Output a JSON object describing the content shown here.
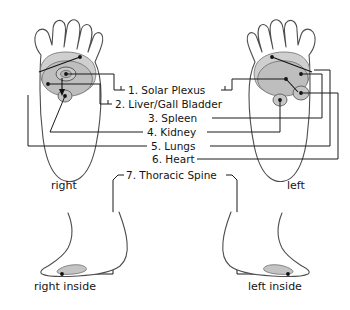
{
  "diagram": {
    "legend_items": [
      {
        "number": "1.",
        "label": "1. Solar Plexus"
      },
      {
        "number": "2.",
        "label": "2. Liver/Gall Bladder"
      },
      {
        "number": "3.",
        "label": "3. Spleen"
      },
      {
        "number": "4.",
        "label": "4. Kidney"
      },
      {
        "number": "5.",
        "label": "5. Lungs"
      },
      {
        "number": "6.",
        "label": "6. Heart"
      },
      {
        "number": "7.",
        "label": "7. Thoracic Spine"
      }
    ],
    "foot_labels": {
      "right_sole": "right",
      "left_sole": "left",
      "right_inside": "right inside",
      "left_inside": "left inside"
    },
    "colors": {
      "outline": "#4d4d4d",
      "zone_light": "#d6d6d6",
      "zone_mid": "#c2c2c2",
      "zone_dark": "#ababab",
      "leader_line": "#1a1a1a",
      "text": "#141414",
      "background": "#ffffff"
    }
  }
}
